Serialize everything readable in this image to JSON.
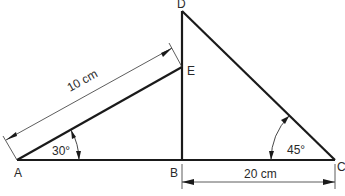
{
  "diagram": {
    "points": {
      "A": {
        "label": "A",
        "x": 17,
        "y": 160
      },
      "B": {
        "label": "B",
        "x": 182,
        "y": 160
      },
      "C": {
        "label": "C",
        "x": 335,
        "y": 160
      },
      "D": {
        "label": "D",
        "x": 182,
        "y": 11
      },
      "E": {
        "label": "E",
        "x": 182,
        "y": 67
      }
    },
    "segments": [
      "AC",
      "AE",
      "BD",
      "DC"
    ],
    "angles": {
      "A": {
        "label": "30°"
      },
      "C": {
        "label": "45°"
      }
    },
    "dimensions": {
      "AE": {
        "label": "10 cm"
      },
      "BC": {
        "label": "20 cm"
      }
    },
    "colors": {
      "stroke": "#1a1a1a",
      "text": "#2a2a2a",
      "background": "#ffffff"
    }
  }
}
